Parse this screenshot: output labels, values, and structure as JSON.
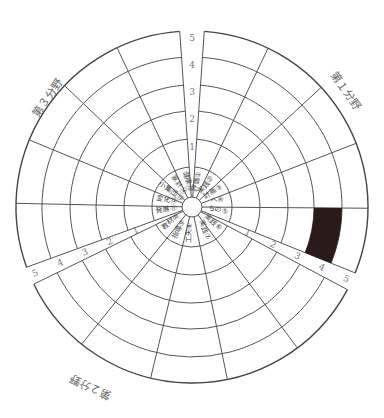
{
  "chart_data": {
    "type": "radar-wheel",
    "title": "",
    "scale_ticks": [
      "1",
      "2",
      "3",
      "4",
      "5"
    ],
    "sectors": [
      {
        "name": "第1分野",
        "items": [
          "①",
          "②",
          "③",
          "④",
          "⑤"
        ]
      },
      {
        "name": "第2分野",
        "items": [
          "⑥",
          "⑦",
          "⑧",
          "⑨",
          "⑩"
        ]
      },
      {
        "name": "第3分野",
        "items": [
          "⑪",
          "⑫",
          "⑬",
          "⑭",
          "⑮"
        ]
      }
    ],
    "items": [
      {
        "id": "①",
        "label": "評価①"
      },
      {
        "id": "②",
        "label": "実践②"
      },
      {
        "id": "③",
        "label": "計画③"
      },
      {
        "id": "④",
        "label": "へ④"
      },
      {
        "id": "⑤",
        "label": "ちの⑤"
      },
      {
        "id": "⑥",
        "label": "実践⑥"
      },
      {
        "id": "⑦",
        "label": "実践⑦"
      },
      {
        "id": "⑧",
        "label": "工夫⑧"
      },
      {
        "id": "⑨",
        "label": "指導⑨"
      },
      {
        "id": "⑩",
        "label": "教材⑩"
      },
      {
        "id": "⑪",
        "label": "発展⑪"
      },
      {
        "id": "⑫",
        "label": "変化⑫"
      },
      {
        "id": "⑬",
        "label": "小集団⑬"
      },
      {
        "id": "⑭",
        "label": "家計⑭"
      },
      {
        "id": "⑮",
        "label": "健康⑮"
      }
    ],
    "filled_cells": [
      {
        "item": "⑤",
        "level": 4
      }
    ]
  },
  "labels": {
    "sector1": "第１分野",
    "sector2": "第２分野",
    "sector3": "第３分野",
    "scale": [
      "1",
      "2",
      "3",
      "4",
      "5"
    ]
  }
}
